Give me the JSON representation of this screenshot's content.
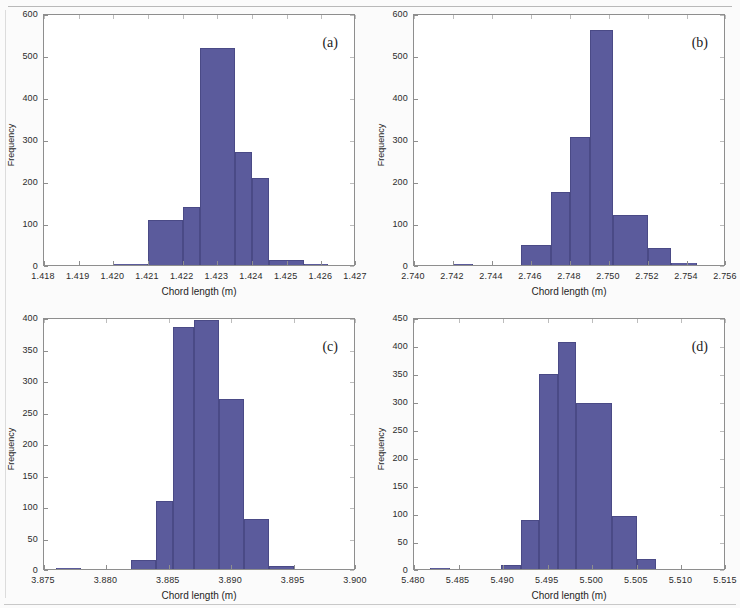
{
  "figure": {
    "panel_count": 4,
    "bar_color": "#5b5b9c",
    "axis_color": "#8e8e8e",
    "common_xlabel": "Chord length (m)",
    "common_ylabel": "Frequency"
  },
  "panels": [
    {
      "tag": "(a)",
      "xlabel": "Chord length (m)",
      "ylabel": "Frequency",
      "xticks": [
        "1.418",
        "1.419",
        "1.420",
        "1.421",
        "1.422",
        "1.423",
        "1.424",
        "1.425",
        "1.426",
        "1.427"
      ],
      "yticks": [
        "0",
        "100",
        "200",
        "300",
        "400",
        "500",
        "600"
      ]
    },
    {
      "tag": "(b)",
      "xlabel": "Chord length (m)",
      "ylabel": "Frequency",
      "xticks": [
        "2.740",
        "2.742",
        "2.744",
        "2.746",
        "2.748",
        "2.750",
        "2.752",
        "2.754",
        "2.756"
      ],
      "yticks": [
        "0",
        "100",
        "200",
        "300",
        "400",
        "500",
        "600"
      ]
    },
    {
      "tag": "(c)",
      "xlabel": "Chord length (m)",
      "ylabel": "Frequency",
      "xticks": [
        "3.875",
        "3.880",
        "3.885",
        "3.890",
        "3.895",
        "3.900"
      ],
      "yticks": [
        "0",
        "50",
        "100",
        "150",
        "200",
        "250",
        "300",
        "350",
        "400"
      ]
    },
    {
      "tag": "(d)",
      "xlabel": "Chord length (m)",
      "ylabel": "Frequency",
      "xticks": [
        "5.480",
        "5.485",
        "5.490",
        "5.495",
        "5.500",
        "5.505",
        "5.510",
        "5.515"
      ],
      "yticks": [
        "0",
        "50",
        "100",
        "150",
        "200",
        "250",
        "300",
        "350",
        "400",
        "450"
      ]
    }
  ],
  "chart_data": [
    {
      "type": "bar",
      "panel": "(a)",
      "title": "",
      "xlabel": "Chord length (m)",
      "ylabel": "Frequency",
      "xlim": [
        1.418,
        1.427
      ],
      "ylim": [
        0,
        600
      ],
      "xtick_step": 0.001,
      "ytick_step": 100,
      "grid": false,
      "legend": null,
      "bins": [
        {
          "x0": 1.42,
          "x1": 1.421,
          "value": 2
        },
        {
          "x0": 1.421,
          "x1": 1.422,
          "value": 108
        },
        {
          "x0": 1.422,
          "x1": 1.4225,
          "value": 138
        },
        {
          "x0": 1.4225,
          "x1": 1.4235,
          "value": 517
        },
        {
          "x0": 1.4235,
          "x1": 1.424,
          "value": 270
        },
        {
          "x0": 1.424,
          "x1": 1.4245,
          "value": 208
        },
        {
          "x0": 1.4245,
          "x1": 1.4255,
          "value": 13
        },
        {
          "x0": 1.4255,
          "x1": 1.4262,
          "value": 2
        }
      ]
    },
    {
      "type": "bar",
      "panel": "(b)",
      "title": "",
      "xlabel": "Chord length (m)",
      "ylabel": "Frequency",
      "xlim": [
        2.74,
        2.756
      ],
      "ylim": [
        0,
        600
      ],
      "xtick_step": 0.002,
      "ytick_step": 100,
      "grid": false,
      "legend": null,
      "bins": [
        {
          "x0": 2.742,
          "x1": 2.743,
          "value": 1
        },
        {
          "x0": 2.7455,
          "x1": 2.747,
          "value": 47
        },
        {
          "x0": 2.747,
          "x1": 2.748,
          "value": 175
        },
        {
          "x0": 2.748,
          "x1": 2.749,
          "value": 305
        },
        {
          "x0": 2.749,
          "x1": 2.7502,
          "value": 560
        },
        {
          "x0": 2.7502,
          "x1": 2.752,
          "value": 120
        },
        {
          "x0": 2.752,
          "x1": 2.7532,
          "value": 40
        },
        {
          "x0": 2.7532,
          "x1": 2.7545,
          "value": 5
        }
      ]
    },
    {
      "type": "bar",
      "panel": "(c)",
      "title": "",
      "xlabel": "Chord length (m)",
      "ylabel": "Frequency",
      "xlim": [
        3.875,
        3.9
      ],
      "ylim": [
        0,
        400
      ],
      "xtick_step": 0.005,
      "ytick_step": 50,
      "grid": false,
      "legend": null,
      "bins": [
        {
          "x0": 3.876,
          "x1": 3.878,
          "value": 2
        },
        {
          "x0": 3.882,
          "x1": 3.884,
          "value": 15
        },
        {
          "x0": 3.884,
          "x1": 3.8853,
          "value": 108
        },
        {
          "x0": 3.8853,
          "x1": 3.887,
          "value": 384
        },
        {
          "x0": 3.887,
          "x1": 3.889,
          "value": 396
        },
        {
          "x0": 3.889,
          "x1": 3.891,
          "value": 270
        },
        {
          "x0": 3.891,
          "x1": 3.893,
          "value": 79
        },
        {
          "x0": 3.893,
          "x1": 3.895,
          "value": 5
        }
      ]
    },
    {
      "type": "bar",
      "panel": "(d)",
      "title": "",
      "xlabel": "Chord length (m)",
      "ylabel": "Frequency",
      "xlim": [
        5.48,
        5.515
      ],
      "ylim": [
        0,
        450
      ],
      "xtick_step": 0.005,
      "ytick_step": 50,
      "grid": false,
      "legend": null,
      "bins": [
        {
          "x0": 5.4818,
          "x1": 5.484,
          "value": 2
        },
        {
          "x0": 5.4898,
          "x1": 5.492,
          "value": 7
        },
        {
          "x0": 5.492,
          "x1": 5.494,
          "value": 87
        },
        {
          "x0": 5.494,
          "x1": 5.4962,
          "value": 349
        },
        {
          "x0": 5.4962,
          "x1": 5.4982,
          "value": 405
        },
        {
          "x0": 5.4982,
          "x1": 5.5022,
          "value": 297
        },
        {
          "x0": 5.5022,
          "x1": 5.505,
          "value": 95
        },
        {
          "x0": 5.505,
          "x1": 5.5072,
          "value": 18
        }
      ]
    }
  ]
}
